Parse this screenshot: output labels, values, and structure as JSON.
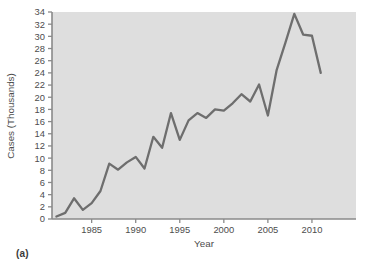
{
  "figure": {
    "caption": "(a)"
  },
  "chart_data": {
    "type": "line",
    "title": "",
    "xlabel": "Year",
    "ylabel": "Cases (Thousands)",
    "xlim": [
      1980.5,
      2015
    ],
    "ylim": [
      0,
      34
    ],
    "grid": false,
    "legend": null,
    "xticks": [
      1985,
      1990,
      1995,
      2000,
      2005,
      2010
    ],
    "xticklabels": [
      "1985",
      "1990",
      "1995",
      "2000",
      "2005",
      "2010"
    ],
    "yticks": [
      0,
      2,
      4,
      6,
      8,
      10,
      12,
      14,
      16,
      18,
      20,
      22,
      24,
      26,
      28,
      30,
      32,
      34
    ],
    "yticklabels": [
      "0",
      "2",
      "4",
      "6",
      "8",
      "10",
      "12",
      "14",
      "16",
      "18",
      "20",
      "22",
      "24",
      "26",
      "28",
      "30",
      "32",
      "34"
    ],
    "x": [
      1981,
      1982,
      1983,
      1984,
      1985,
      1986,
      1987,
      1988,
      1989,
      1990,
      1991,
      1992,
      1993,
      1994,
      1995,
      1996,
      1997,
      1998,
      1999,
      2000,
      2001,
      2002,
      2003,
      2004,
      2005,
      2006,
      2007,
      2008,
      2009,
      2010,
      2011
    ],
    "values": [
      0.4,
      1.0,
      3.4,
      1.5,
      2.6,
      4.6,
      9.1,
      8.1,
      9.3,
      10.2,
      8.3,
      13.5,
      11.7,
      17.4,
      13.0,
      16.2,
      17.4,
      16.6,
      18.0,
      17.8,
      19.0,
      20.5,
      19.3,
      22.1,
      17.0,
      24.5,
      29.0,
      33.7,
      30.3,
      30.1,
      24.0
    ],
    "series": [
      {
        "name": "Cases",
        "color": "#6e6e6e",
        "values": [
          0.4,
          1.0,
          3.4,
          1.5,
          2.6,
          4.6,
          9.1,
          8.1,
          9.3,
          10.2,
          8.3,
          13.5,
          11.7,
          17.4,
          13.0,
          16.2,
          17.4,
          16.6,
          18.0,
          17.8,
          19.0,
          20.5,
          19.3,
          22.1,
          17.0,
          24.5,
          29.0,
          33.7,
          30.3,
          30.1,
          24.0
        ]
      }
    ],
    "colors": {
      "line": "#6e6e6e",
      "plot_background": "#dedede",
      "axis": "#8a8a8a",
      "text": "#4d4d4d"
    }
  }
}
